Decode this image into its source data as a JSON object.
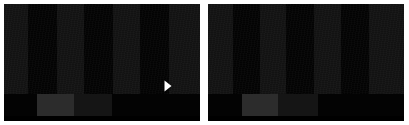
{
  "canvas": {
    "width": 409,
    "height": 125,
    "background": "#ffffff",
    "description": "Two side-by-side dark video thumbnails"
  },
  "panels": [
    {
      "id": "panel-left",
      "name": "video-thumbnail-left",
      "x": 4,
      "y": 4,
      "width": 196,
      "height": 117,
      "frame": {
        "height": 90,
        "base_color": "#131313",
        "bar_color": "#040404",
        "bars": [
          {
            "x": 24,
            "width": 29
          },
          {
            "x": 80,
            "width": 29
          },
          {
            "x": 136,
            "width": 29
          }
        ]
      },
      "bottom_band": {
        "height": 27,
        "base_color": "#070707",
        "blocks": [
          {
            "x": 0,
            "width": 33,
            "tone": "dark"
          },
          {
            "x": 33,
            "width": 37,
            "tone": "light"
          },
          {
            "x": 70,
            "width": 38,
            "tone": "mid"
          },
          {
            "x": 108,
            "width": 88,
            "tone": "dark"
          }
        ]
      },
      "play_button": {
        "visible": true,
        "x": 160,
        "y": 76,
        "width": 8,
        "height": 12,
        "color": "#ffffff",
        "label": "Play"
      }
    },
    {
      "id": "panel-right",
      "name": "video-thumbnail-right",
      "x": 208,
      "y": 4,
      "width": 196,
      "height": 117,
      "frame": {
        "height": 90,
        "base_color": "#131313",
        "bar_color": "#040404",
        "bars": [
          {
            "x": 25,
            "width": 27
          },
          {
            "x": 78,
            "width": 28
          },
          {
            "x": 133,
            "width": 28
          }
        ]
      },
      "bottom_band": {
        "height": 27,
        "base_color": "#070707",
        "blocks": [
          {
            "x": 0,
            "width": 34,
            "tone": "dark"
          },
          {
            "x": 34,
            "width": 36,
            "tone": "light"
          },
          {
            "x": 70,
            "width": 40,
            "tone": "mid"
          },
          {
            "x": 110,
            "width": 86,
            "tone": "dark"
          }
        ]
      },
      "play_button": {
        "visible": false,
        "x": 0,
        "y": 0,
        "width": 0,
        "height": 0,
        "color": "#ffffff",
        "label": "Play"
      }
    }
  ],
  "colors": {
    "page_background": "#ffffff",
    "frame_base": "#131313",
    "frame_bar": "#040404",
    "band_base": "#070707",
    "band_light": "#2c2c2c",
    "band_mid": "#151515",
    "band_dark": "#030303",
    "play_icon": "#ffffff"
  }
}
